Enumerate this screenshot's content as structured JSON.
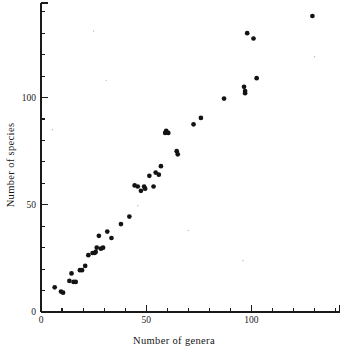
{
  "chart_data": {
    "type": "scatter",
    "title": "",
    "xlabel": "Number of genera",
    "ylabel": "Number of species",
    "xlim": [
      0,
      142
    ],
    "ylim": [
      0,
      144
    ],
    "grid": false,
    "legend": null,
    "x_ticks_major": [
      0,
      50,
      100
    ],
    "x_tick_labels": [
      "0",
      "50",
      "100"
    ],
    "x_ticks_minor": [
      10,
      20,
      30,
      40,
      60,
      70,
      80,
      90,
      110,
      120,
      130,
      140
    ],
    "y_ticks_major": [
      0,
      50,
      100
    ],
    "y_tick_labels": [
      "0",
      "50",
      "100"
    ],
    "y_ticks_minor": [
      10,
      20,
      30,
      40,
      60,
      70,
      80,
      90,
      110,
      120,
      130,
      140
    ],
    "marker": "filled-circle",
    "marker_color": "#131313",
    "points": [
      {
        "x": 6.5,
        "y": 11.5
      },
      {
        "x": 9.5,
        "y": 9.5
      },
      {
        "x": 10.5,
        "y": 9.0
      },
      {
        "x": 13.5,
        "y": 14.5
      },
      {
        "x": 14.5,
        "y": 18.0
      },
      {
        "x": 15.5,
        "y": 14.0
      },
      {
        "x": 16.5,
        "y": 14.0
      },
      {
        "x": 18.5,
        "y": 19.5
      },
      {
        "x": 19.5,
        "y": 19.5
      },
      {
        "x": 21.0,
        "y": 21.5
      },
      {
        "x": 22.5,
        "y": 26.5
      },
      {
        "x": 24.5,
        "y": 27.5
      },
      {
        "x": 25.5,
        "y": 27.5
      },
      {
        "x": 26.0,
        "y": 28.0
      },
      {
        "x": 26.5,
        "y": 30.0
      },
      {
        "x": 27.5,
        "y": 35.5
      },
      {
        "x": 28.5,
        "y": 29.5
      },
      {
        "x": 29.5,
        "y": 30.0
      },
      {
        "x": 31.5,
        "y": 37.5
      },
      {
        "x": 33.5,
        "y": 34.5
      },
      {
        "x": 38.0,
        "y": 41.0
      },
      {
        "x": 42.0,
        "y": 44.5
      },
      {
        "x": 44.5,
        "y": 59.0
      },
      {
        "x": 46.0,
        "y": 58.5
      },
      {
        "x": 47.5,
        "y": 56.5
      },
      {
        "x": 49.0,
        "y": 58.5
      },
      {
        "x": 49.5,
        "y": 57.5
      },
      {
        "x": 51.5,
        "y": 63.5
      },
      {
        "x": 53.5,
        "y": 58.5
      },
      {
        "x": 54.5,
        "y": 65.0
      },
      {
        "x": 56.0,
        "y": 64.0
      },
      {
        "x": 57.0,
        "y": 68.0
      },
      {
        "x": 59.0,
        "y": 83.5
      },
      {
        "x": 59.5,
        "y": 84.5
      },
      {
        "x": 60.5,
        "y": 83.5
      },
      {
        "x": 64.5,
        "y": 75.0
      },
      {
        "x": 65.0,
        "y": 73.5
      },
      {
        "x": 72.5,
        "y": 87.5
      },
      {
        "x": 76.0,
        "y": 90.5
      },
      {
        "x": 87.0,
        "y": 99.5
      },
      {
        "x": 96.5,
        "y": 105.0
      },
      {
        "x": 97.0,
        "y": 102.0
      },
      {
        "x": 97.0,
        "y": 103.0
      },
      {
        "x": 98.0,
        "y": 130.0
      },
      {
        "x": 101.0,
        "y": 127.5
      },
      {
        "x": 102.5,
        "y": 109.0
      },
      {
        "x": 129.0,
        "y": 138.0
      }
    ],
    "specks": [
      {
        "x": 25.0,
        "y": 131.0
      },
      {
        "x": 31.0,
        "y": 108.0
      },
      {
        "x": 46.0,
        "y": 49.5
      },
      {
        "x": 70.0,
        "y": 38.0
      },
      {
        "x": 96.0,
        "y": 24.0
      },
      {
        "x": 130.0,
        "y": 119.0
      },
      {
        "x": 5.5,
        "y": 85.0
      }
    ]
  },
  "axis_labels": {
    "x_title": "Number of genera",
    "y_title": "Number of species"
  }
}
